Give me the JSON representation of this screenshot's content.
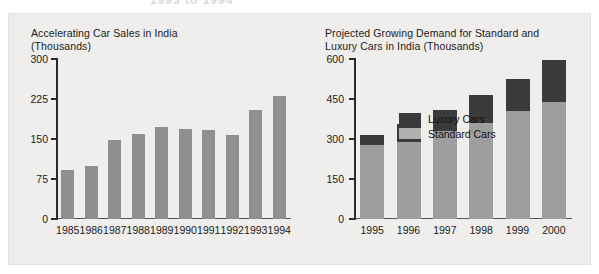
{
  "page": {
    "background": "#efeeec",
    "cut_header_text": "1993 to 1994"
  },
  "colors": {
    "standard_bar": "#9e9e9e",
    "luxury_bar": "#3b3b3b",
    "single_bar": "#8f8f8f",
    "axis": "#2b2b2b",
    "text": "#1b1b1b"
  },
  "chart_data": [
    {
      "id": "car-sales-india",
      "type": "bar",
      "title": "Accelerating Car Sales in India\n(Thousands)",
      "title_line1": "Accelerating Car Sales in India",
      "title_line2": "(Thousands)",
      "xlabel": "",
      "ylabel": "",
      "ylim": [
        0,
        300
      ],
      "yticks": [
        0,
        75,
        150,
        225,
        300
      ],
      "ytick_labels": [
        "0",
        "75",
        "150",
        "225",
        "300"
      ],
      "grid": false,
      "legend": null,
      "categories": [
        "1985",
        "1986",
        "1987",
        "1988",
        "1989",
        "1990",
        "1991",
        "1992",
        "1993",
        "1994"
      ],
      "values": [
        92,
        100,
        148,
        160,
        172,
        168,
        167,
        158,
        205,
        230
      ]
    },
    {
      "id": "projected-demand-standard-luxury",
      "type": "bar",
      "stacked": true,
      "title": "Projected Growing Demand for Standard and\nLuxury Cars in India (Thousands)",
      "title_line1": "Projected Growing Demand for Standard and",
      "title_line2": "Luxury Cars in India (Thousands)",
      "xlabel": "",
      "ylabel": "",
      "ylim": [
        0,
        600
      ],
      "yticks": [
        0,
        150,
        300,
        450,
        600
      ],
      "ytick_labels": [
        "0",
        "150",
        "300",
        "450",
        "600"
      ],
      "grid": false,
      "legend_position": "inside-top-left",
      "legend": [
        {
          "name": "Luxury Cars",
          "color": "#3b3b3b"
        },
        {
          "name": "Standard Cars",
          "color": "#b0b0b0"
        }
      ],
      "categories": [
        "1995",
        "1996",
        "1997",
        "1998",
        "1999",
        "2000"
      ],
      "series": [
        {
          "name": "Standard Cars",
          "color": "#9e9e9e",
          "values": [
            278,
            290,
            330,
            360,
            405,
            440
          ]
        },
        {
          "name": "Luxury Cars",
          "color": "#3b3b3b",
          "values": [
            37,
            65,
            80,
            105,
            120,
            155
          ]
        }
      ],
      "totals": [
        315,
        355,
        410,
        465,
        525,
        595
      ]
    }
  ]
}
